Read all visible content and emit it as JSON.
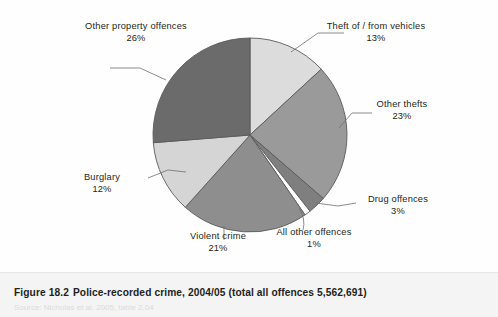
{
  "figure": {
    "number": "Figure 18.2",
    "caption": "Police-recorded crime, 2004/05 (total all offences 5,562,691)",
    "source": "Source: Nicholas et al. 2005, table 2.04"
  },
  "chart_data": {
    "type": "pie",
    "title": "Police-recorded crime, 2004/05 (total all offences 5,562,691)",
    "total_label": "total all offences 5,562,691",
    "total_value": 5562691,
    "year": "2004/05",
    "units": "percent of all recorded offences",
    "start_angle_deg": 0,
    "direction": "clockwise",
    "legend": "none (direct labels with leader lines)",
    "categories": [
      "Theft of / from vehicles",
      "Other thefts",
      "Drug offences",
      "All other offences",
      "Violent crime",
      "Burglary",
      "Other property offences"
    ],
    "values": [
      13,
      23,
      3,
      1,
      21,
      12,
      26
    ],
    "labels": [
      "13%",
      "23%",
      "3%",
      "1%",
      "21%",
      "12%",
      "26%"
    ],
    "colors": [
      "#dcdcdc",
      "#9a9a9a",
      "#7f7f7f",
      "#ffffff",
      "#8e8e8e",
      "#d5d5d5",
      "#6b6b6b"
    ],
    "slices": [
      {
        "name": "Theft of / from vehicles",
        "value": 13,
        "label": "13%",
        "color": "#dcdcdc"
      },
      {
        "name": "Other thefts",
        "value": 23,
        "label": "23%",
        "color": "#9a9a9a"
      },
      {
        "name": "Drug offences",
        "value": 3,
        "label": "3%",
        "color": "#7f7f7f"
      },
      {
        "name": "All other offences",
        "value": 1,
        "label": "1%",
        "color": "#ffffff"
      },
      {
        "name": "Violent crime",
        "value": 21,
        "label": "21%",
        "color": "#8e8e8e"
      },
      {
        "name": "Burglary",
        "value": 12,
        "label": "12%",
        "color": "#d5d5d5"
      },
      {
        "name": "Other property offences",
        "value": 26,
        "label": "26%",
        "color": "#6b6b6b"
      }
    ]
  }
}
